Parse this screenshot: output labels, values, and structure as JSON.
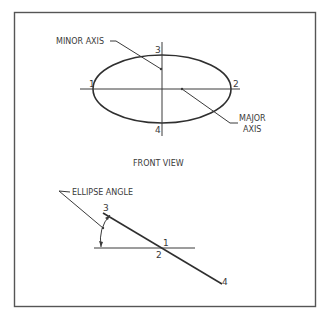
{
  "front_view": {
    "title": "FRONT VIEW",
    "minor_axis_label": "MINOR AXIS",
    "major_axis_label_line1": "MAJOR",
    "major_axis_label_line2": "AXIS",
    "points": {
      "p1": "1",
      "p2": "2",
      "p3": "3",
      "p4": "4"
    }
  },
  "edge_view": {
    "ellipse_angle_label": "ELLIPSE ANGLE",
    "points": {
      "p1": "1",
      "p2": "2",
      "p3": "3",
      "p4": "4"
    }
  },
  "colors": {
    "line": "#3a3a3a",
    "frame": "#555555",
    "background": "#ffffff"
  }
}
